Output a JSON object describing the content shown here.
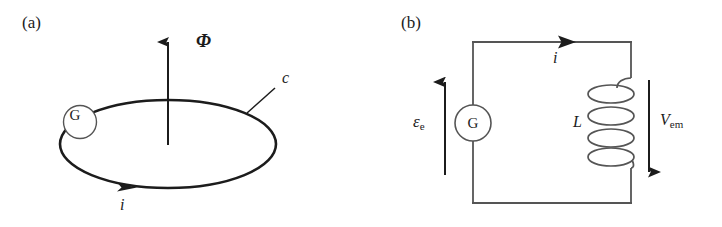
{
  "figure": {
    "background_color": "#ffffff",
    "ink_color": "#1c1c1c",
    "panels": [
      {
        "id": "a",
        "tag": "(a)",
        "description": "conducting loop with magnetic flux",
        "elements": {
          "flux_label": "Φ",
          "contour_label": "c",
          "current_label": "i",
          "generator_label": "G"
        }
      },
      {
        "id": "b",
        "tag": "(b)",
        "description": "equivalent circuit with emf source and inductor",
        "elements": {
          "emf_symbol": "ε",
          "emf_subscript": "e",
          "current_label": "i",
          "inductance_label": "L",
          "voltage_symbol": "V",
          "voltage_subscript": "em",
          "generator_label": "G"
        }
      }
    ]
  }
}
